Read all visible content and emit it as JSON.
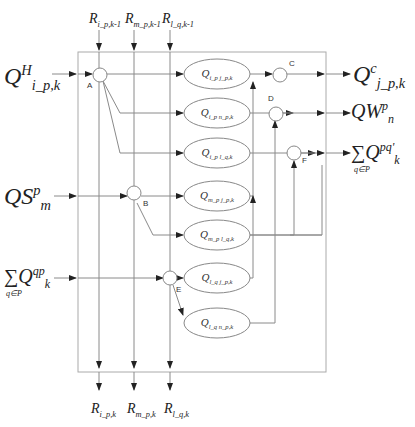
{
  "diagram": {
    "type": "flow-network",
    "colors": {
      "line": "#8a8a8a",
      "arrow": "#222222",
      "box": "#aaaaaa",
      "text": "#222222"
    },
    "inputs": [
      {
        "id": "in-qh",
        "main": "Q",
        "sup": "H",
        "sub": "i_p,k"
      },
      {
        "id": "in-qs",
        "main": "QS",
        "sup": "p",
        "sub": "m"
      },
      {
        "id": "in-sum",
        "main": "∑Q",
        "sup": "qp",
        "sub": "k",
        "under": "q∈P"
      }
    ],
    "outputs": [
      {
        "id": "out-qc",
        "main": "Q",
        "sup": "c",
        "sub": "j_p,k"
      },
      {
        "id": "out-qw",
        "main": "QW",
        "sup": "p",
        "sub": "n"
      },
      {
        "id": "out-sum",
        "main": "∑Q",
        "sup": "pq'",
        "sub": "k",
        "under": "q∈P"
      }
    ],
    "top_labels": [
      {
        "main": "R",
        "sub": "i_p,k-1"
      },
      {
        "main": "R",
        "sub": "m_p,k-1"
      },
      {
        "main": "R",
        "sub": "l_q,k-1"
      }
    ],
    "bottom_labels": [
      {
        "main": "R",
        "sub": "i_p,k"
      },
      {
        "main": "R",
        "sub": "m_p,k"
      },
      {
        "main": "R",
        "sub": "l_q,k"
      }
    ],
    "nodes": [
      "A",
      "B",
      "C",
      "D",
      "E",
      "F"
    ],
    "flows": [
      {
        "main": "Q",
        "sub": "i_p j_p,k"
      },
      {
        "main": "Q",
        "sub": "i_p n_p,k"
      },
      {
        "main": "Q",
        "sub": "i_p l_q,k"
      },
      {
        "main": "Q",
        "sub": "m_p j_p,k"
      },
      {
        "main": "Q",
        "sub": "m_p l_q,k"
      },
      {
        "main": "Q",
        "sub": "l_q j_p,k"
      },
      {
        "main": "Q",
        "sub": "l_q n_p,k"
      }
    ]
  }
}
